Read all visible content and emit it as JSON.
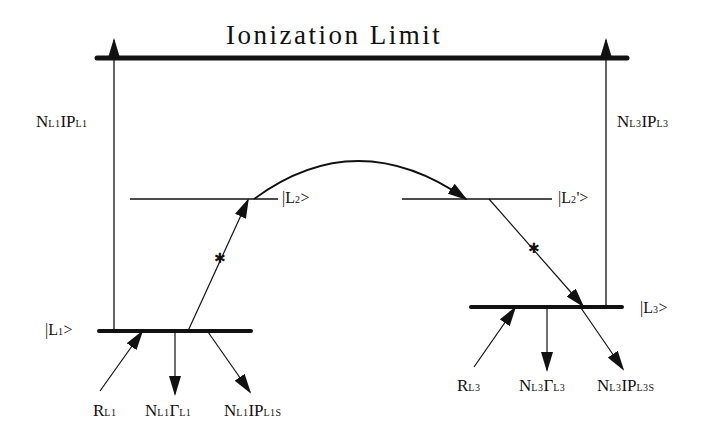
{
  "diagram": {
    "title": "Ionization Limit",
    "colors": {
      "ink": "#111111",
      "background": "#ffffff"
    },
    "levels": [
      {
        "id": "L1",
        "label_prefix": "|L",
        "label_sub": "1",
        "label_suffix": ">"
      },
      {
        "id": "L2",
        "label_prefix": "|L",
        "label_sub": "2",
        "label_suffix": ">"
      },
      {
        "id": "L2p",
        "label_prefix": "|L",
        "label_sub": "2",
        "label_suffix": "'>"
      },
      {
        "id": "L3",
        "label_prefix": "|L",
        "label_sub": "3",
        "label_suffix": ">"
      }
    ],
    "ionization_arrows": {
      "left": {
        "n": "N",
        "n_sub": "L1",
        "ip": "IP",
        "ip_sub": "L1"
      },
      "right": {
        "n": "N",
        "n_sub": "L3",
        "ip": "IP",
        "ip_sub": "L3"
      }
    },
    "bottom_labels_left": [
      {
        "main": "R",
        "sub": "L1"
      },
      {
        "main": "N",
        "sub": "L1",
        "main2": "Γ",
        "sub2": "L1"
      },
      {
        "main": "N",
        "sub": "L1",
        "main2": "IP",
        "sub2": "L1S"
      }
    ],
    "bottom_labels_right": [
      {
        "main": "R",
        "sub": "L3"
      },
      {
        "main": "N",
        "sub": "L3",
        "main2": "Γ",
        "sub2": "L3"
      },
      {
        "main": "N",
        "sub": "L3",
        "main2": "IP",
        "sub2": "L3S"
      }
    ],
    "transitions": [
      {
        "from": "L1",
        "to": "L2",
        "type": "excitation",
        "marker": "star"
      },
      {
        "from": "L2",
        "to": "L2p",
        "type": "curved-transfer"
      },
      {
        "from": "L2p",
        "to": "L3",
        "type": "decay",
        "marker": "star"
      },
      {
        "from": "L1",
        "to": "Ionization Limit",
        "type": "ionization"
      },
      {
        "from": "L3",
        "to": "Ionization Limit",
        "type": "ionization"
      }
    ]
  }
}
